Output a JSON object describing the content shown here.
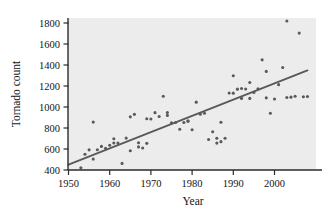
{
  "chart_data": {
    "type": "scatter",
    "title": "",
    "xlabel": "Year",
    "ylabel": "Tornado count",
    "xlim": [
      1949,
      2009
    ],
    "ylim": [
      400,
      1870
    ],
    "xticks": [
      1950,
      1960,
      1970,
      1980,
      1990,
      2000
    ],
    "xtick_labels": [
      "1950",
      "1960",
      "1970",
      "1980",
      "1990",
      "2000"
    ],
    "yticks": [
      400,
      600,
      800,
      1000,
      1200,
      1400,
      1600,
      1800
    ],
    "ytick_labels": [
      "400",
      "600",
      "800",
      "1000",
      "1200",
      "1400",
      "1600",
      "1800"
    ],
    "grid": false,
    "legend": null,
    "point_color": "#595959",
    "line_color": "#595959",
    "panel_color": "#ececec",
    "x": [
      1953,
      1954,
      1955,
      1956,
      1956,
      1957,
      1958,
      1959,
      1960,
      1961,
      1961,
      1962,
      1963,
      1964,
      1965,
      1965,
      1966,
      1967,
      1967,
      1968,
      1969,
      1969,
      1970,
      1971,
      1972,
      1973,
      1974,
      1974,
      1975,
      1976,
      1977,
      1978,
      1979,
      1979,
      1980,
      1981,
      1982,
      1983,
      1984,
      1985,
      1986,
      1986,
      1987,
      1987,
      1988,
      1989,
      1990,
      1990,
      1991,
      1992,
      1992,
      1993,
      1994,
      1994,
      1995,
      1996,
      1997,
      1998,
      1998,
      1999,
      2000,
      2001,
      2002,
      2003,
      2003,
      2004,
      2005,
      2006,
      2007,
      2008
    ],
    "y": [
      421,
      550,
      592,
      504,
      856,
      593,
      625,
      606,
      636,
      697,
      657,
      657,
      463,
      704,
      584,
      906,
      930,
      660,
      620,
      609,
      654,
      888,
      886,
      946,
      910,
      1102,
      947,
      920,
      849,
      852,
      788,
      852,
      865,
      866,
      783,
      1046,
      931,
      940,
      690,
      765,
      656,
      702,
      855,
      670,
      702,
      1133,
      1132,
      1297,
      1170,
      1176,
      1082,
      1172,
      1082,
      1234,
      1139,
      1173,
      1449,
      1339,
      1087,
      941,
      1076,
      1213,
      1376,
      1819,
      1091,
      1094,
      1103,
      1704,
      1098,
      1100
    ],
    "trend_line": {
      "x_start": 1950,
      "y_start": 452,
      "x_end": 2008,
      "y_end": 1348,
      "slope": 15.4,
      "intercept": 452
    },
    "n_points": 70
  },
  "figure": {
    "x_axis_name": "x-axis",
    "y_axis_name": "y-axis"
  }
}
